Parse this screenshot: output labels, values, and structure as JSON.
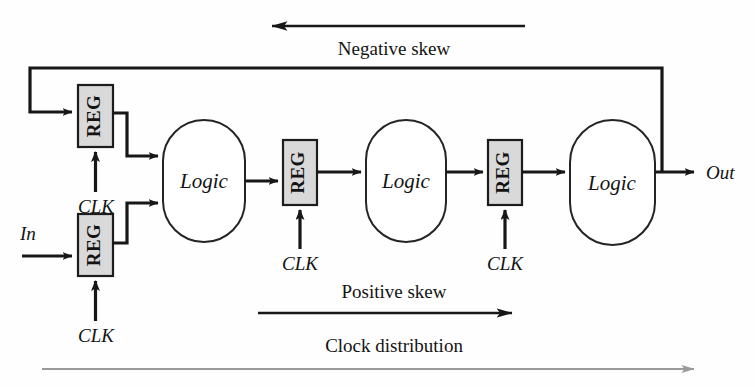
{
  "diagram": {
    "colors": {
      "wire": "#171717",
      "reg_fill": "#d9d9d9",
      "reg_stroke": "#1c1c1c",
      "logic_stroke": "#242424",
      "logic_fill": "#ffffff",
      "gray_arrow": "#9a9a9a",
      "background": "#ffffff",
      "text": "#131313"
    },
    "registers": [
      {
        "id": "reg-feedback",
        "label": "REG",
        "x": 78,
        "y": 85,
        "w": 35,
        "h": 62,
        "clk_label": "CLK"
      },
      {
        "id": "reg-input",
        "label": "REG",
        "x": 78,
        "y": 214,
        "w": 35,
        "h": 62,
        "clk_label": "CLK"
      },
      {
        "id": "reg-stage2",
        "label": "REG",
        "x": 283,
        "y": 140,
        "w": 34,
        "h": 65,
        "clk_label": "CLK"
      },
      {
        "id": "reg-stage3",
        "label": "REG",
        "x": 488,
        "y": 140,
        "w": 34,
        "h": 65,
        "clk_label": "CLK"
      }
    ],
    "logic_blocks": [
      {
        "id": "logic-1",
        "label": "Logic",
        "x": 163,
        "y": 120,
        "w": 82,
        "h": 122
      },
      {
        "id": "logic-2",
        "label": "Logic",
        "x": 366,
        "y": 120,
        "w": 80,
        "h": 122
      },
      {
        "id": "logic-3",
        "label": "Logic",
        "x": 570,
        "y": 120,
        "w": 85,
        "h": 125
      }
    ],
    "io": {
      "input_label": "In",
      "output_label": "Out"
    },
    "clock_labels": [
      {
        "text": "CLK",
        "x": 96,
        "y": 199
      },
      {
        "text": "CLK",
        "x": 96,
        "y": 328
      },
      {
        "text": "CLK",
        "x": 300,
        "y": 256
      },
      {
        "text": "CLK",
        "x": 505,
        "y": 256
      }
    ],
    "annotations": [
      {
        "id": "negative-skew",
        "label": "Negative skew",
        "direction": "left",
        "label_x": 394,
        "label_y": 48,
        "arrow_y": 26,
        "arrow_x1": 525,
        "arrow_x2": 264
      },
      {
        "id": "positive-skew",
        "label": "Positive skew",
        "direction": "right",
        "label_x": 394,
        "label_y": 291,
        "arrow_y": 309,
        "arrow_x1": 258,
        "arrow_x2": 518
      },
      {
        "id": "clock-distribution",
        "label": "Clock distribution",
        "direction": "right",
        "label_x": 394,
        "label_y": 345,
        "arrow_y": 366,
        "arrow_x1": 42,
        "arrow_x2": 700
      }
    ]
  }
}
